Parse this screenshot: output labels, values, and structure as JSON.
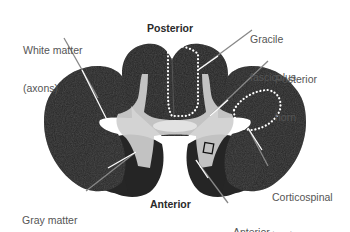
{
  "figure": {
    "orientation": {
      "top": "Posterior",
      "bottom": "Anterior"
    },
    "labels": {
      "white_matter": {
        "line1": "White matter",
        "line2": "(axons)"
      },
      "gray_matter": {
        "line1": "Gray matter",
        "line2": "(neuron cell bodies)"
      },
      "gracile_fasciculus": {
        "line1": "Gracile",
        "line2": "fasciculus"
      },
      "posterior_horn": {
        "line1": "Posterior",
        "line2": "horn"
      },
      "corticospinal_tract": {
        "line1": "Corticospinal",
        "line2": "tract"
      },
      "anterior_horn": {
        "line1": "Anterior",
        "line2": "horn"
      }
    },
    "colors": {
      "white_matter": "#262626",
      "gray_matter": "#cfcfcf",
      "leader_line": "#ffffff",
      "outline_dots": "#ffffff",
      "label_text": "#555555"
    }
  }
}
